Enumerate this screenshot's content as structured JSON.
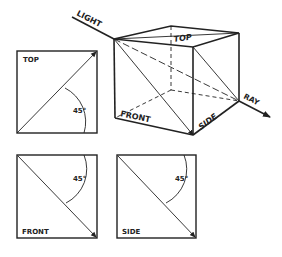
{
  "diagram": {
    "cube": {
      "labels": {
        "top": "TOP",
        "front": "FRONT",
        "side": "SIDE"
      },
      "light_label": "LIGHT",
      "ray_label": "RAY"
    },
    "views": [
      {
        "name": "TOP",
        "angle": "45°"
      },
      {
        "name": "FRONT",
        "angle": "45°"
      },
      {
        "name": "SIDE",
        "angle": "45°"
      }
    ],
    "colors": {
      "ink": "#222222",
      "background": "#ffffff"
    }
  }
}
